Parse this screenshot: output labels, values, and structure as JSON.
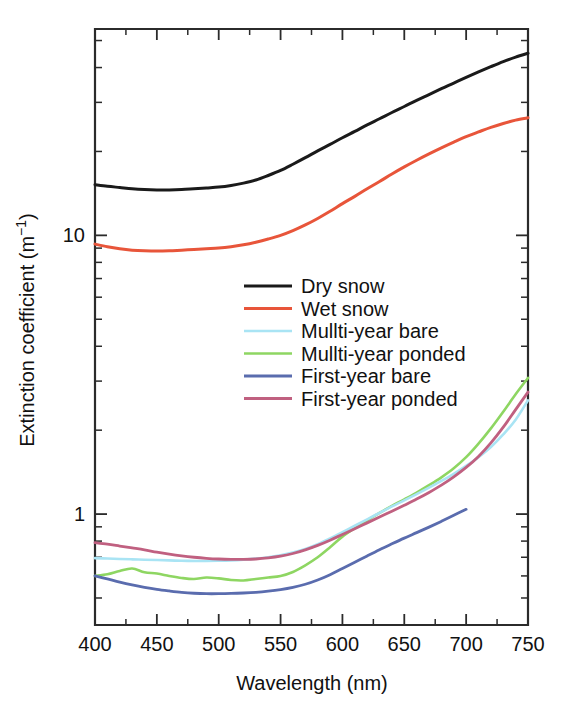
{
  "chart_data": {
    "type": "line",
    "title": "",
    "xlabel": "Wavelength (nm)",
    "ylabel": "Extinction coefficient (m⁻¹)",
    "xlim": [
      400,
      750
    ],
    "ylim": [
      0.4,
      55
    ],
    "yscale": "log",
    "xscale": "linear",
    "grid": false,
    "legend_position": "center",
    "x_ticks_major": [
      400,
      450,
      500,
      550,
      600,
      650,
      700,
      750
    ],
    "x_ticks_minor": [
      425,
      475,
      525,
      575,
      625,
      675,
      725
    ],
    "x_tick_labels": [
      "400",
      "450",
      "500",
      "550",
      "600",
      "650",
      "700",
      "750"
    ],
    "y_ticks_major": [
      1,
      10
    ],
    "y_tick_labels": [
      "1",
      "10"
    ],
    "y_ticks_minor": [
      0.5,
      0.6,
      0.7,
      0.8,
      0.9,
      2,
      3,
      4,
      5,
      6,
      7,
      8,
      9,
      20,
      30,
      40,
      50
    ],
    "x": [
      400,
      410,
      420,
      430,
      440,
      450,
      460,
      470,
      480,
      490,
      500,
      510,
      520,
      530,
      540,
      550,
      560,
      570,
      580,
      590,
      600,
      610,
      620,
      630,
      640,
      650,
      660,
      670,
      680,
      690,
      700,
      710,
      720,
      730,
      740,
      750
    ],
    "series": [
      {
        "name": "Dry snow",
        "color": "#1a1a1a",
        "width": 3.0,
        "values": [
          15.2,
          15.0,
          14.85,
          14.7,
          14.6,
          14.55,
          14.55,
          14.6,
          14.7,
          14.8,
          14.9,
          15.1,
          15.4,
          15.8,
          16.4,
          17.1,
          18.0,
          19.0,
          20.1,
          21.2,
          22.4,
          23.6,
          24.9,
          26.2,
          27.6,
          29.0,
          30.5,
          32.0,
          33.6,
          35.2,
          36.9,
          38.6,
          40.3,
          42.0,
          43.6,
          45.0
        ]
      },
      {
        "name": "Wet snow",
        "color": "#e8553a",
        "width": 3.0,
        "values": [
          9.3,
          9.1,
          8.95,
          8.85,
          8.8,
          8.78,
          8.8,
          8.85,
          8.9,
          8.95,
          9.0,
          9.1,
          9.25,
          9.45,
          9.7,
          10.0,
          10.4,
          10.9,
          11.5,
          12.2,
          13.0,
          13.8,
          14.7,
          15.6,
          16.6,
          17.6,
          18.6,
          19.6,
          20.6,
          21.6,
          22.6,
          23.5,
          24.4,
          25.2,
          25.9,
          26.4
        ]
      },
      {
        "name": "Mullti-year bare",
        "color": "#a9e4f4",
        "width": 2.6,
        "values": [
          0.695,
          0.693,
          0.69,
          0.688,
          0.686,
          0.684,
          0.682,
          0.68,
          0.679,
          0.679,
          0.68,
          0.682,
          0.686,
          0.692,
          0.7,
          0.712,
          0.728,
          0.75,
          0.78,
          0.818,
          0.862,
          0.908,
          0.958,
          1.01,
          1.065,
          1.12,
          1.18,
          1.245,
          1.315,
          1.395,
          1.49,
          1.6,
          1.74,
          1.93,
          2.18,
          2.56
        ]
      },
      {
        "name": "Mullti-year ponded",
        "color": "#8ed662",
        "width": 2.6,
        "values": [
          0.6,
          0.608,
          0.625,
          0.638,
          0.618,
          0.612,
          0.6,
          0.59,
          0.585,
          0.592,
          0.588,
          0.58,
          0.578,
          0.585,
          0.592,
          0.6,
          0.62,
          0.655,
          0.7,
          0.76,
          0.83,
          0.89,
          0.95,
          1.01,
          1.07,
          1.13,
          1.195,
          1.27,
          1.355,
          1.46,
          1.6,
          1.79,
          2.03,
          2.33,
          2.69,
          3.08
        ]
      },
      {
        "name": "First-year bare",
        "color": "#5a6cae",
        "width": 2.8,
        "values": [
          0.6,
          0.585,
          0.57,
          0.557,
          0.546,
          0.537,
          0.53,
          0.524,
          0.52,
          0.518,
          0.518,
          0.519,
          0.521,
          0.524,
          0.529,
          0.536,
          0.546,
          0.56,
          0.58,
          0.606,
          0.638,
          0.672,
          0.708,
          0.745,
          0.782,
          0.82,
          0.858,
          0.898,
          0.942,
          0.99,
          1.04,
          1.085,
          1.125,
          1.16,
          1.19,
          1.215
        ]
      },
      {
        "name": "First-year ponded",
        "color": "#c06080",
        "width": 2.8,
        "values": [
          0.79,
          0.78,
          0.768,
          0.756,
          0.744,
          0.73,
          0.718,
          0.708,
          0.7,
          0.694,
          0.69,
          0.688,
          0.688,
          0.69,
          0.696,
          0.706,
          0.722,
          0.744,
          0.772,
          0.806,
          0.845,
          0.886,
          0.93,
          0.976,
          1.024,
          1.076,
          1.132,
          1.196,
          1.27,
          1.36,
          1.47,
          1.61,
          1.8,
          2.05,
          2.37,
          2.74
        ]
      }
    ]
  },
  "legend": {
    "items": [
      {
        "label": "Dry snow"
      },
      {
        "label": "Wet snow"
      },
      {
        "label": "Mullti-year bare"
      },
      {
        "label": "Mullti-year ponded"
      },
      {
        "label": "First-year bare"
      },
      {
        "label": "First-year ponded"
      }
    ]
  }
}
